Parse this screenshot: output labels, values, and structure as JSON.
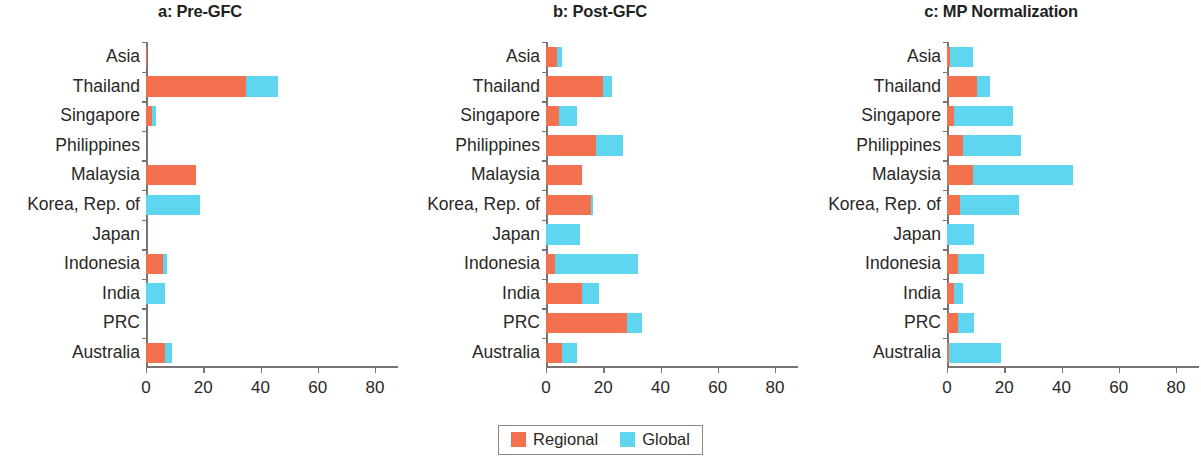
{
  "figure": {
    "categories": [
      "Asia",
      "Thailand",
      "Singapore",
      "Philippines",
      "Malaysia",
      "Korea, Rep. of",
      "Japan",
      "Indonesia",
      "India",
      "PRC",
      "Australia"
    ],
    "xticks": [
      "0",
      "20",
      "40",
      "60",
      "80"
    ],
    "legend": {
      "regional_label": "Regional",
      "global_label": "Global",
      "regional_color": "#F4714F",
      "global_color": "#5FD6F0"
    }
  },
  "chart_data": [
    {
      "type": "bar",
      "title": "a: Pre-GFC",
      "orientation": "horizontal",
      "stacked": true,
      "categories": [
        "Asia",
        "Thailand",
        "Singapore",
        "Philippines",
        "Malaysia",
        "Korea, Rep. of",
        "Japan",
        "Indonesia",
        "India",
        "PRC",
        "Australia"
      ],
      "series": [
        {
          "name": "Regional",
          "color": "#F4714F",
          "values": [
            0.4,
            35.0,
            2.2,
            0.0,
            17.5,
            0.0,
            0.0,
            6.0,
            0.0,
            0.0,
            6.5
          ]
        },
        {
          "name": "Global",
          "color": "#5FD6F0",
          "values": [
            0.0,
            11.0,
            1.4,
            0.0,
            0.0,
            19.0,
            0.0,
            1.5,
            6.5,
            0.0,
            2.5
          ]
        }
      ],
      "xlabel": "",
      "ylabel": "",
      "xlim": [
        0,
        88
      ],
      "xticks": [
        0,
        20,
        40,
        60,
        80
      ],
      "grid": false,
      "legend_position": "bottom-center-shared"
    },
    {
      "type": "bar",
      "title": "b: Post-GFC",
      "orientation": "horizontal",
      "stacked": true,
      "categories": [
        "Asia",
        "Thailand",
        "Singapore",
        "Philippines",
        "Malaysia",
        "Korea, Rep. of",
        "Japan",
        "Indonesia",
        "India",
        "PRC",
        "Australia"
      ],
      "series": [
        {
          "name": "Regional",
          "color": "#F4714F",
          "values": [
            4.0,
            20.0,
            4.4,
            17.6,
            12.4,
            15.6,
            0.0,
            3.0,
            12.4,
            28.4,
            5.6
          ]
        },
        {
          "name": "Global",
          "color": "#5FD6F0",
          "values": [
            1.6,
            3.0,
            6.6,
            9.4,
            0.0,
            0.8,
            12.0,
            29.0,
            6.0,
            5.2,
            5.4
          ]
        }
      ],
      "xlabel": "",
      "ylabel": "",
      "xlim": [
        0,
        88
      ],
      "xticks": [
        0,
        20,
        40,
        60,
        80
      ],
      "grid": false,
      "legend_position": "bottom-center-shared"
    },
    {
      "type": "bar",
      "title": "c: MP Normalization",
      "orientation": "horizontal",
      "stacked": true,
      "categories": [
        "Asia",
        "Thailand",
        "Singapore",
        "Philippines",
        "Malaysia",
        "Korea, Rep. of",
        "Japan",
        "Indonesia",
        "India",
        "PRC",
        "Australia"
      ],
      "series": [
        {
          "name": "Regional",
          "color": "#F4714F",
          "values": [
            1.2,
            10.5,
            2.4,
            5.6,
            9.0,
            4.4,
            0.0,
            4.0,
            2.4,
            4.0,
            0.8
          ]
        },
        {
          "name": "Global",
          "color": "#5FD6F0",
          "values": [
            7.8,
            4.5,
            20.6,
            20.4,
            35.0,
            20.6,
            9.6,
            9.0,
            3.2,
            5.6,
            18.2
          ]
        }
      ],
      "xlabel": "",
      "ylabel": "",
      "xlim": [
        0,
        88
      ],
      "xticks": [
        0,
        20,
        40,
        60,
        80
      ],
      "grid": false,
      "legend_position": "bottom-center-shared"
    }
  ]
}
